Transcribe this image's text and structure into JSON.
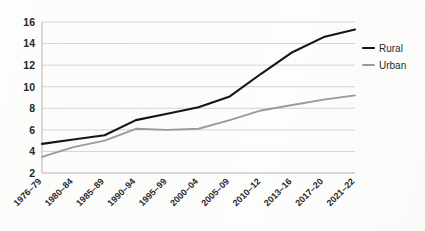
{
  "chart_data": {
    "type": "line",
    "title": "",
    "subtitle": "",
    "xlabel": "",
    "ylabel": "",
    "ylim": [
      2,
      16
    ],
    "yticks": [
      2,
      4,
      6,
      8,
      10,
      12,
      14,
      16
    ],
    "ytick_labels": [
      "2",
      "4",
      "6",
      "8",
      "10",
      "12",
      "14",
      "16"
    ],
    "grid": true,
    "legend_position": "right",
    "categories": [
      "1976–79",
      "1980–84",
      "1985–89",
      "1990–94",
      "1995–99",
      "2000–04",
      "2005–09",
      "2010–12",
      "2013–16",
      "2017–20",
      "2021–22"
    ],
    "series": [
      {
        "name": "Rural",
        "color": "#151515",
        "values": [
          4.7,
          5.1,
          5.5,
          6.9,
          7.5,
          8.1,
          9.1,
          11.2,
          13.2,
          14.6,
          15.3
        ]
      },
      {
        "name": "Urban",
        "color": "#9a9a9a",
        "values": [
          3.5,
          4.4,
          5.0,
          6.1,
          6.0,
          6.1,
          6.9,
          7.8,
          8.3,
          8.8,
          9.2
        ]
      }
    ]
  },
  "legend": {
    "items": [
      {
        "label": "Rural",
        "color": "#151515"
      },
      {
        "label": "Urban",
        "color": "#9a9a9a"
      }
    ]
  }
}
